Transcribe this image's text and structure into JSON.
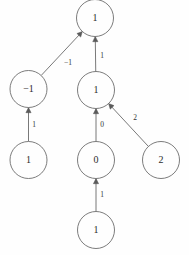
{
  "diagram": {
    "type": "directed-graph",
    "background_color": "#fefefe",
    "node_stroke_color": "#6d6d6d",
    "edge_color": "#6a6a6a",
    "text_color": "#2b2b2b",
    "node_radius": 18.5,
    "nodes": [
      {
        "id": "n-top",
        "label": "1",
        "cx": 95,
        "cy": 18
      },
      {
        "id": "n-left-mid",
        "label": "-1",
        "cx": 28.5,
        "cy": 89
      },
      {
        "id": "n-center-mid",
        "label": "1",
        "cx": 96,
        "cy": 90
      },
      {
        "id": "n-left-low",
        "label": "1",
        "cx": 28.5,
        "cy": 160
      },
      {
        "id": "n-center-low",
        "label": "0",
        "cx": 96,
        "cy": 160
      },
      {
        "id": "n-right-low",
        "label": "2",
        "cx": 161,
        "cy": 160
      },
      {
        "id": "n-bottom",
        "label": "1",
        "cx": 96,
        "cy": 230
      }
    ],
    "edges": [
      {
        "id": "e-leftmid-to-top",
        "from": "n-left-mid",
        "to": "n-top",
        "label": "-1",
        "label_x": 68,
        "label_y": 63
      },
      {
        "id": "e-centermid-to-top",
        "from": "n-center-mid",
        "to": "n-top",
        "label": "1",
        "label_x": 102,
        "label_y": 56
      },
      {
        "id": "e-leftlow-to-leftmid",
        "from": "n-left-low",
        "to": "n-left-mid",
        "label": "1",
        "label_x": 34,
        "label_y": 125
      },
      {
        "id": "e-centerlow-to-centermid",
        "from": "n-center-low",
        "to": "n-center-mid",
        "label": "0",
        "label_x": 102,
        "label_y": 125
      },
      {
        "id": "e-rightlow-to-centermid",
        "from": "n-right-low",
        "to": "n-center-mid",
        "label": "2",
        "label_x": 135,
        "label_y": 118
      },
      {
        "id": "e-bottom-to-centerlow",
        "from": "n-bottom",
        "to": "n-center-low",
        "label": "1",
        "label_x": 102,
        "label_y": 195
      }
    ]
  }
}
